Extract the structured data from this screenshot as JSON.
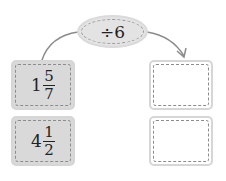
{
  "operation": {
    "label": "÷6"
  },
  "inputs": [
    {
      "whole": "1",
      "numerator": "5",
      "denominator": "7"
    },
    {
      "whole": "4",
      "numerator": "1",
      "denominator": "2"
    }
  ],
  "outputs": [
    {
      "value": ""
    },
    {
      "value": ""
    }
  ]
}
